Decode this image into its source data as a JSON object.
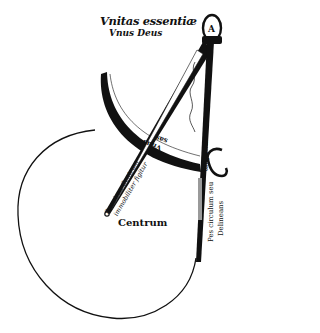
{
  "figure": {
    "labels": {
      "top_line1": "Vnitas essentiæ",
      "top_line2": "Vnus Deus",
      "center": "Centrum",
      "right_leg_line1": "Pes circulum seu",
      "right_leg_line2": "Delineans",
      "right_leg_upper": "mundum",
      "left_leg_line1": "Pes circa Centrum",
      "left_leg_line2": "immobiliter figitur",
      "arc_word1": "Vnus",
      "arc_word2": "sas"
    },
    "hinge_letter": "A",
    "colors": {
      "ink": "#111111",
      "paper": "#ffffff",
      "shade": "#9a9a9a"
    }
  }
}
